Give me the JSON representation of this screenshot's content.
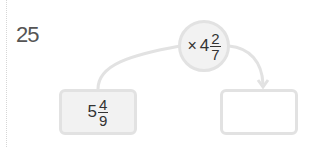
{
  "question": {
    "number": "25"
  },
  "operator": {
    "symbol": "×",
    "whole": "4",
    "numerator": "2",
    "denominator": "7"
  },
  "start_box": {
    "whole": "5",
    "numerator": "4",
    "denominator": "9"
  },
  "answer_box": {
    "value": ""
  },
  "colors": {
    "border": "#e2e2e2",
    "fill": "#f2f2f2",
    "text": "#333333",
    "number": "#555555"
  }
}
